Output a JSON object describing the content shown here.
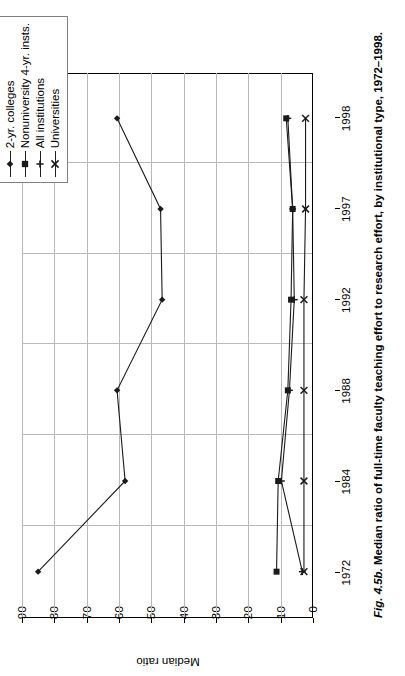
{
  "figure": {
    "caption_prefix": "Fig. 4.5b.",
    "caption_text": " Median ratio of full-time faculty teaching effort to research effort, by institutional type, 1972–1998."
  },
  "legend": {
    "entries": [
      {
        "label": "2-yr. colleges",
        "marker": "diamond-marker-icon"
      },
      {
        "label": "Nonuniversity 4-yr. insts.",
        "marker": "square-marker-icon"
      },
      {
        "label": "All institutions",
        "marker": "plus-marker-icon"
      },
      {
        "label": "Universities",
        "marker": "x-marker-icon"
      }
    ]
  },
  "chart_data": {
    "type": "line",
    "title": "",
    "xlabel": "",
    "ylabel": "Median ratio",
    "grid": true,
    "legend_position": "top-right",
    "orientation": "rotated-90-ccw",
    "categories": [
      "1972",
      "1984",
      "1988",
      "1992",
      "1997",
      "1998"
    ],
    "x_tick_labels": [
      "1972",
      "1984",
      "1988",
      "1992",
      "1997",
      "1998"
    ],
    "y_tick_labels": [
      "0",
      "10",
      "20",
      "30",
      "40",
      "50",
      "60",
      "70",
      "80",
      "90"
    ],
    "ylim": [
      0,
      90
    ],
    "ytick_step": 10,
    "series": [
      {
        "name": "2-yr. colleges",
        "marker": "diamond",
        "values": [
          85,
          58,
          60.5,
          46.5,
          47,
          60.5
        ]
      },
      {
        "name": "Nonuniversity 4-yr. insts.",
        "marker": "square",
        "values": [
          11,
          10.5,
          7.5,
          6.5,
          6,
          8
        ]
      },
      {
        "name": "All institutions",
        "marker": "plus",
        "values": [
          3,
          9.5,
          7,
          5.5,
          6,
          7.5
        ]
      },
      {
        "name": "Universities",
        "marker": "x",
        "values": [
          2.5,
          2.5,
          2.5,
          2.5,
          2,
          2
        ]
      }
    ]
  },
  "colors": {
    "line": "#1a1a1a",
    "grid": "#b9b9b9",
    "axis": "#000000",
    "legend_border": "#808080",
    "background": "#ffffff"
  }
}
